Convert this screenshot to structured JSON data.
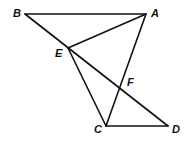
{
  "diagram": {
    "type": "geometry",
    "points": [
      {
        "id": "A",
        "label": "A",
        "x": 146,
        "y": 14,
        "lx": 151,
        "ly": 17
      },
      {
        "id": "B",
        "label": "B",
        "x": 25,
        "y": 14,
        "lx": 13,
        "ly": 17
      },
      {
        "id": "C",
        "label": "C",
        "x": 106,
        "y": 126,
        "lx": 94,
        "ly": 133
      },
      {
        "id": "D",
        "label": "D",
        "x": 168,
        "y": 126,
        "lx": 172,
        "ly": 133
      },
      {
        "id": "E",
        "label": "E",
        "x": 68,
        "y": 48,
        "lx": 55,
        "ly": 57
      },
      {
        "id": "F",
        "label": "F",
        "x": 120,
        "y": 87,
        "lx": 127,
        "ly": 86
      }
    ],
    "segments": [
      [
        "B",
        "A"
      ],
      [
        "B",
        "D"
      ],
      [
        "A",
        "E"
      ],
      [
        "A",
        "C"
      ],
      [
        "E",
        "C"
      ],
      [
        "C",
        "D"
      ]
    ]
  }
}
